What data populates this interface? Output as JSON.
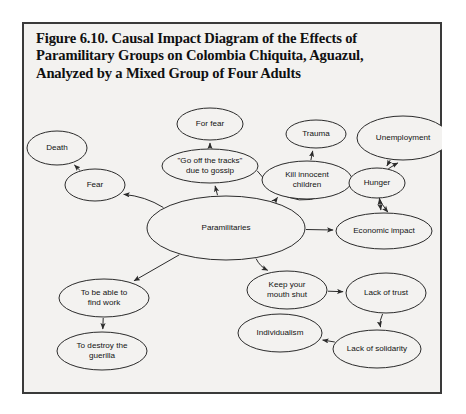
{
  "figure": {
    "title_lines": [
      "Figure 6.10. Causal Impact Diagram of the Effects of",
      "Paramilitary Groups on Colombia Chiquita, Aguazul,",
      "Analyzed by a Mixed Group of Four Adults"
    ],
    "frame_color": "#3a3a3a",
    "background_color": "#f3f2f0",
    "ink_color": "#2b2b2b"
  },
  "chart_data": {
    "type": "diagram",
    "subtype": "causal-impact-diagram",
    "nodes": [
      {
        "id": "death",
        "label": "Death",
        "lines": [
          "Death"
        ],
        "cx": 35,
        "cy": 126,
        "rx": 30,
        "ry": 17
      },
      {
        "id": "fear",
        "label": "Fear",
        "lines": [
          "Fear"
        ],
        "cx": 73,
        "cy": 163,
        "rx": 30,
        "ry": 16
      },
      {
        "id": "for_fear",
        "label": "For fear",
        "lines": [
          "For fear"
        ],
        "cx": 188,
        "cy": 102,
        "rx": 33,
        "ry": 16
      },
      {
        "id": "gossip",
        "label": "\"Go off the tracks\" due to gossip",
        "lines": [
          "\"Go off the tracks\"",
          "due to gossip"
        ],
        "cx": 188,
        "cy": 144,
        "rx": 48,
        "ry": 17
      },
      {
        "id": "trauma",
        "label": "Trauma",
        "lines": [
          "Trauma"
        ],
        "cx": 294,
        "cy": 112,
        "rx": 30,
        "ry": 14
      },
      {
        "id": "unemployment",
        "label": "Unemployment",
        "lines": [
          "Unemployment"
        ],
        "cx": 381,
        "cy": 116,
        "rx": 46,
        "ry": 22
      },
      {
        "id": "kill_children",
        "label": "Kill innocent children",
        "lines": [
          "Kill innocent",
          "children"
        ],
        "cx": 285,
        "cy": 158,
        "rx": 45,
        "ry": 19
      },
      {
        "id": "hunger",
        "label": "Hunger",
        "lines": [
          "Hunger"
        ],
        "cx": 355,
        "cy": 161,
        "rx": 28,
        "ry": 15
      },
      {
        "id": "paramilitaries",
        "label": "Paramilitaries",
        "lines": [
          "Paramilitaries"
        ],
        "cx": 204,
        "cy": 206,
        "rx": 79,
        "ry": 32
      },
      {
        "id": "economic",
        "label": "Economic impact",
        "lines": [
          "Economic impact"
        ],
        "cx": 362,
        "cy": 209,
        "rx": 48,
        "ry": 18
      },
      {
        "id": "find_work",
        "label": "To be able to find work",
        "lines": [
          "To be able to",
          "find work"
        ],
        "cx": 82,
        "cy": 276,
        "rx": 45,
        "ry": 19
      },
      {
        "id": "destroy",
        "label": "To destroy the guerilla",
        "lines": [
          "To destroy the",
          "guerilla"
        ],
        "cx": 80,
        "cy": 329,
        "rx": 45,
        "ry": 19
      },
      {
        "id": "mouth_shut",
        "label": "Keep your mouth shut",
        "lines": [
          "Keep your",
          "mouth shut"
        ],
        "cx": 265,
        "cy": 268,
        "rx": 40,
        "ry": 19
      },
      {
        "id": "lack_trust",
        "label": "Lack of trust",
        "lines": [
          "Lack of trust"
        ],
        "cx": 364,
        "cy": 271,
        "rx": 40,
        "ry": 20
      },
      {
        "id": "lack_solidarity",
        "label": "Lack of solidarity",
        "lines": [
          "Lack of solidarity"
        ],
        "cx": 355,
        "cy": 327,
        "rx": 44,
        "ry": 19
      },
      {
        "id": "individualism",
        "label": "Individualism",
        "lines": [
          "Individualism"
        ],
        "cx": 258,
        "cy": 311,
        "rx": 42,
        "ry": 19
      }
    ],
    "edges": [
      {
        "from": "fear",
        "to": "death",
        "arrow": "single"
      },
      {
        "from": "paramilitaries",
        "to": "fear",
        "arrow": "single"
      },
      {
        "from": "gossip",
        "to": "for_fear",
        "arrow": "single"
      },
      {
        "from": "paramilitaries",
        "to": "gossip",
        "arrow": "single"
      },
      {
        "from": "kill_children",
        "to": "trauma",
        "arrow": "single"
      },
      {
        "from": "paramilitaries",
        "to": "kill_children",
        "arrow": "single"
      },
      {
        "from": "gossip",
        "to": "hunger",
        "arrow": "single"
      },
      {
        "from": "unemployment",
        "to": "hunger",
        "arrow": "single"
      },
      {
        "from": "hunger",
        "to": "economic",
        "arrow": "double"
      },
      {
        "from": "economic",
        "to": "unemployment",
        "arrow": "double"
      },
      {
        "from": "paramilitaries",
        "to": "economic",
        "arrow": "single"
      },
      {
        "from": "paramilitaries",
        "to": "find_work",
        "arrow": "single"
      },
      {
        "from": "find_work",
        "to": "destroy",
        "arrow": "single"
      },
      {
        "from": "paramilitaries",
        "to": "mouth_shut",
        "arrow": "single"
      },
      {
        "from": "mouth_shut",
        "to": "lack_trust",
        "arrow": "single"
      },
      {
        "from": "lack_trust",
        "to": "lack_solidarity",
        "arrow": "single"
      },
      {
        "from": "lack_solidarity",
        "to": "individualism",
        "arrow": "single"
      }
    ]
  }
}
